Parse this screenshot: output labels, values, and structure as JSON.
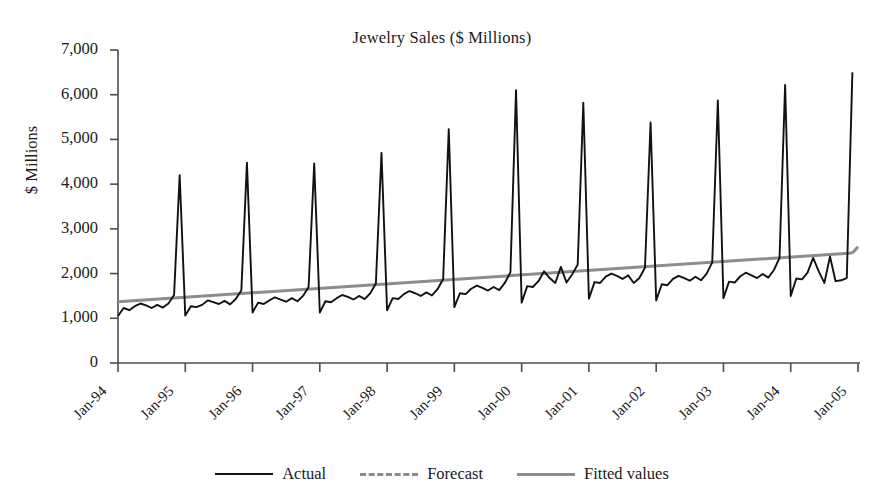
{
  "chart_data": {
    "type": "line",
    "title": "Jewelry Sales ($ Millions)",
    "xlabel": "",
    "ylabel": "$ Millions",
    "ylim": [
      0,
      7000
    ],
    "ytick_labels": [
      "7,000",
      "6,000",
      "5,000",
      "4,000",
      "3,000",
      "2,000",
      "1,000",
      "0"
    ],
    "ytick_values": [
      7000,
      6000,
      5000,
      4000,
      3000,
      2000,
      1000,
      0
    ],
    "xtick_labels": [
      "Jan-94",
      "Jan-95",
      "Jan-96",
      "Jan-97",
      "Jan-98",
      "Jan-99",
      "Jan-00",
      "Jan-01",
      "Jan-02",
      "Jan-03",
      "Jan-04",
      "Jan-05"
    ],
    "grid": false,
    "legend_position": "bottom",
    "legend": [
      "Actual",
      "Forecast",
      "Fitted values"
    ],
    "colors": {
      "actual": "#111111",
      "forecast": "#8c8c8c",
      "fitted": "#8c8c8c"
    },
    "x_start_label": "Jan-94",
    "x_end_label": "Jan-05",
    "series": [
      {
        "name": "Actual",
        "style": "solid",
        "color": "#111111",
        "x": [
          "Jan-94",
          "Feb-94",
          "Mar-94",
          "Apr-94",
          "May-94",
          "Jun-94",
          "Jul-94",
          "Aug-94",
          "Sep-94",
          "Oct-94",
          "Nov-94",
          "Dec-94",
          "Jan-95",
          "Feb-95",
          "Mar-95",
          "Apr-95",
          "May-95",
          "Jun-95",
          "Jul-95",
          "Aug-95",
          "Sep-95",
          "Oct-95",
          "Nov-95",
          "Dec-95",
          "Jan-96",
          "Feb-96",
          "Mar-96",
          "Apr-96",
          "May-96",
          "Jun-96",
          "Jul-96",
          "Aug-96",
          "Sep-96",
          "Oct-96",
          "Nov-96",
          "Dec-96",
          "Jan-97",
          "Feb-97",
          "Mar-97",
          "Apr-97",
          "May-97",
          "Jun-97",
          "Jul-97",
          "Aug-97",
          "Sep-97",
          "Oct-97",
          "Nov-97",
          "Dec-97",
          "Jan-98",
          "Feb-98",
          "Mar-98",
          "Apr-98",
          "May-98",
          "Jun-98",
          "Jul-98",
          "Aug-98",
          "Sep-98",
          "Oct-98",
          "Nov-98",
          "Dec-98",
          "Jan-99",
          "Feb-99",
          "Mar-99",
          "Apr-99",
          "May-99",
          "Jun-99",
          "Jul-99",
          "Aug-99",
          "Sep-99",
          "Oct-99",
          "Nov-99",
          "Dec-99",
          "Jan-00",
          "Feb-00",
          "Mar-00",
          "Apr-00",
          "May-00",
          "Jun-00",
          "Jul-00",
          "Aug-00",
          "Sep-00",
          "Oct-00",
          "Nov-00",
          "Dec-00",
          "Jan-01",
          "Feb-01",
          "Mar-01",
          "Apr-01",
          "May-01",
          "Jun-01",
          "Jul-01",
          "Aug-01",
          "Sep-01",
          "Oct-01",
          "Nov-01",
          "Dec-01",
          "Jan-02",
          "Feb-02",
          "Mar-02",
          "Apr-02",
          "May-02",
          "Jun-02",
          "Jul-02",
          "Aug-02",
          "Sep-02",
          "Oct-02",
          "Nov-02",
          "Dec-02",
          "Jan-03",
          "Feb-03",
          "Mar-03",
          "Apr-03",
          "May-03",
          "Jun-03",
          "Jul-03",
          "Aug-03",
          "Sep-03",
          "Oct-03",
          "Nov-03",
          "Dec-03",
          "Jan-04",
          "Feb-04",
          "Mar-04",
          "Apr-04",
          "May-04",
          "Jun-04",
          "Jul-04",
          "Aug-04",
          "Sep-04",
          "Oct-04",
          "Nov-04",
          "Dec-04"
        ],
        "values": [
          1050,
          1230,
          1180,
          1270,
          1330,
          1290,
          1230,
          1300,
          1240,
          1330,
          1520,
          4200,
          1060,
          1270,
          1250,
          1300,
          1400,
          1360,
          1320,
          1390,
          1310,
          1430,
          1620,
          4480,
          1130,
          1350,
          1320,
          1400,
          1470,
          1420,
          1370,
          1450,
          1380,
          1500,
          1700,
          4460,
          1130,
          1380,
          1360,
          1450,
          1520,
          1480,
          1420,
          1500,
          1430,
          1560,
          1780,
          4700,
          1180,
          1450,
          1430,
          1540,
          1610,
          1560,
          1500,
          1580,
          1510,
          1650,
          1880,
          5230,
          1250,
          1560,
          1540,
          1660,
          1730,
          1680,
          1620,
          1700,
          1630,
          1790,
          2030,
          6100,
          1350,
          1720,
          1700,
          1830,
          2050,
          1900,
          1790,
          2150,
          1800,
          1980,
          2200,
          5820,
          1440,
          1810,
          1790,
          1930,
          2000,
          1950,
          1880,
          1960,
          1790,
          1900,
          2130,
          5380,
          1400,
          1760,
          1740,
          1880,
          1950,
          1900,
          1840,
          1930,
          1850,
          2000,
          2250,
          5870,
          1450,
          1820,
          1800,
          1940,
          2020,
          1960,
          1900,
          1990,
          1910,
          2080,
          2350,
          6220,
          1500,
          1890,
          1870,
          2020,
          2350,
          2050,
          1790,
          2380,
          1830,
          1850,
          1900,
          6500
        ]
      },
      {
        "name": "Fitted values",
        "style": "solid",
        "color": "#8c8c8c",
        "x": [
          "Jan-94",
          "Dec-04"
        ],
        "values": [
          1370,
          2460
        ]
      },
      {
        "name": "Forecast",
        "style": "dashed",
        "color": "#8c8c8c",
        "x": [
          "Dec-04",
          "Dec-05"
        ],
        "values": [
          2460,
          2600
        ]
      }
    ],
    "annotations": [
      {
        "text": "December seasonal peaks",
        "visible": false
      }
    ],
    "peaks": {
      "labels": [
        "Dec-94",
        "Dec-95",
        "Dec-96",
        "Dec-97",
        "Dec-98",
        "Dec-99",
        "Dec-00",
        "Dec-01",
        "Dec-02",
        "Dec-03",
        "Dec-04"
      ],
      "values": [
        4200,
        4480,
        4460,
        4700,
        5230,
        6100,
        5820,
        5380,
        5870,
        6220,
        6500
      ]
    }
  }
}
